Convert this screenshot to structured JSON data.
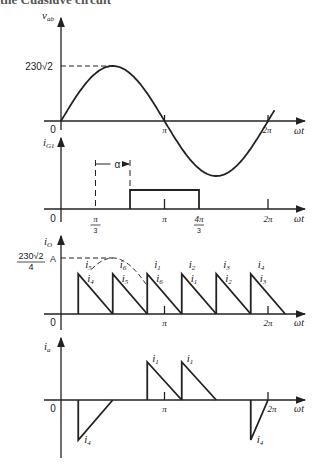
{
  "header_fragment": "the Cuasiuve circuit",
  "panels": [
    {
      "id": "vab",
      "ylabel": "v",
      "ylabel_sub": "ab",
      "xlabel": "ωt",
      "origin_label": "0",
      "peak_label": "230√2",
      "ticks": [
        "π",
        "2π"
      ]
    },
    {
      "id": "iG1",
      "ylabel": "i",
      "ylabel_sub": "G1",
      "xlabel": "ωt",
      "origin_label": "0",
      "alpha_label": "α",
      "ticks": [
        {
          "num": "π",
          "den": "3"
        },
        {
          "num": "π",
          "den": ""
        },
        {
          "num": "4π",
          "den": "3"
        },
        {
          "num": "2π",
          "den": ""
        }
      ]
    },
    {
      "id": "io",
      "ylabel": "i",
      "ylabel_sub": "O",
      "xlabel": "ωt",
      "origin_label": "0",
      "peak_label_num": "230√2",
      "peak_label_den": "4",
      "peak_unit": "A",
      "ticks": [
        "π",
        "2π"
      ],
      "pulse_labels_top": [
        "i5",
        "i6",
        "i1",
        "i2",
        "i3",
        "i4"
      ],
      "pulse_labels_bottom": [
        "i4",
        "i5",
        "i6",
        "i1",
        "i2",
        "i3"
      ]
    },
    {
      "id": "ia",
      "ylabel": "i",
      "ylabel_sub": "a",
      "xlabel": "ωt",
      "origin_label": "0",
      "ticks": [
        "π",
        "2π"
      ],
      "pulse_labels": [
        "i4",
        "i1",
        "i1",
        "i4"
      ]
    }
  ],
  "chart_data": {
    "type": "line",
    "title": "",
    "x_unit": "ωt (rad)",
    "xlim": [
      0,
      6.6
    ],
    "series": [
      {
        "name": "v_ab",
        "function": "230√2·sin(ωt)",
        "x_range": [
          0,
          6.45
        ],
        "peak": "230√2"
      },
      {
        "name": "i_G1",
        "pulse_on": "2π/3",
        "pulse_off": "4π/3",
        "alpha_from": "π/3",
        "alpha_to": "2π/3"
      },
      {
        "name": "i_O",
        "pulses_start": [
          "π/6",
          "π/2",
          "5π/6",
          "7π/6",
          "3π/2",
          "11π/6"
        ],
        "pulse_width": "π/3",
        "envelope_peak": "230√2/4 A"
      },
      {
        "name": "i_a",
        "positive_pulses_start": [
          "5π/6",
          "7π/6"
        ],
        "negative_pulses_start": [
          "π/6",
          "11π/6"
        ]
      }
    ]
  }
}
